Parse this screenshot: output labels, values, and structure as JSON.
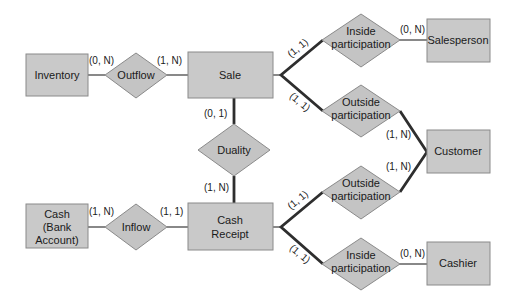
{
  "diagram": {
    "type": "entity-relationship (REA) diagram",
    "entities": {
      "inventory": "Inventory",
      "sale": "Sale",
      "salesperson": "Salesperson",
      "customer": "Customer",
      "cash_line1": "Cash",
      "cash_line2": "(Bank",
      "cash_line3": "Account)",
      "cash_receipt_line1": "Cash",
      "cash_receipt_line2": "Receipt",
      "cashier": "Cashier"
    },
    "relationships": {
      "outflow": "Outflow",
      "duality": "Duality",
      "inflow": "Inflow",
      "inside_participation_sale_line1": "Inside",
      "inside_participation_sale_line2": "participation",
      "outside_participation_sale_line1": "Outside",
      "outside_participation_sale_line2": "participation",
      "outside_participation_receipt_line1": "Outside",
      "outside_participation_receipt_line2": "participation",
      "inside_participation_receipt_line1": "Inside",
      "inside_participation_receipt_line2": "participation"
    },
    "cardinalities": {
      "inventory_outflow": "(0, N)",
      "outflow_sale": "(1, N)",
      "sale_duality": "(0, 1)",
      "duality_receipt": "(1, N)",
      "cash_inflow": "(1, N)",
      "inflow_receipt": "(1, 1)",
      "sale_inside": "(1, 1)",
      "inside_salesperson": "(0, N)",
      "sale_outside": "(1, 1)",
      "outside_customer_top": "(1, N)",
      "outside_customer_bottom": "(1, N)",
      "receipt_outside": "(1, 1)",
      "receipt_inside": "(1, 1)",
      "inside_cashier": "(0, N)"
    },
    "colors": {
      "box_fill": "#c9c9c9",
      "line": "#2e2e2e",
      "background": "#ffffff"
    }
  }
}
